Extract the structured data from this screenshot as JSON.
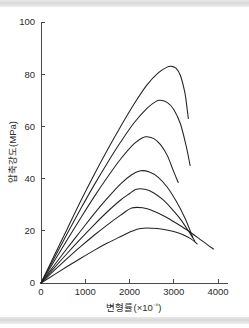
{
  "figure": {
    "background_color": "#ffffff",
    "band_color": "#dcdcdc",
    "curve_color": "#222222",
    "axis_color": "#4a4a4a"
  },
  "chart_data": {
    "type": "line",
    "title": "",
    "xlabel": "변형률(×10⁻⁶)",
    "ylabel": "압축강도(MPa)",
    "xlim": [
      0,
      4300
    ],
    "ylim": [
      0,
      100
    ],
    "xticks": [
      0,
      1000,
      2000,
      3000,
      4000
    ],
    "xtick_labels": [
      "0",
      "1000",
      "2000",
      "3000",
      "4000"
    ],
    "yticks": [
      0,
      20,
      40,
      60,
      80,
      100
    ],
    "ytick_labels": [
      "0",
      "20",
      "40",
      "60",
      "80",
      "100"
    ],
    "grid": false,
    "legend": "none",
    "series": [
      {
        "name": "curve-1",
        "peak_strain": 2950,
        "peak_stress": 83,
        "end_strain": 3330,
        "end_stress": 63,
        "x": [
          0,
          300,
          600,
          900,
          1200,
          1500,
          1800,
          2100,
          2400,
          2650,
          2850,
          2950,
          3050,
          3150,
          3250,
          3300,
          3330
        ],
        "y": [
          0,
          10.5,
          21.0,
          31.5,
          41.5,
          51.0,
          60.0,
          68.5,
          76.0,
          80.5,
          82.7,
          83.0,
          82.3,
          79.5,
          73.0,
          67.0,
          63.0
        ]
      },
      {
        "name": "curve-2",
        "peak_strain": 2700,
        "peak_stress": 70,
        "end_strain": 3370,
        "end_stress": 45,
        "x": [
          0,
          300,
          600,
          900,
          1200,
          1500,
          1800,
          2100,
          2400,
          2600,
          2700,
          2850,
          3000,
          3150,
          3280,
          3370
        ],
        "y": [
          0,
          9.6,
          19.2,
          28.5,
          37.5,
          46.0,
          54.0,
          61.3,
          67.0,
          69.6,
          70.0,
          69.2,
          66.5,
          61.0,
          52.5,
          45.0
        ]
      },
      {
        "name": "curve-3",
        "peak_strain": 2400,
        "peak_stress": 56,
        "end_strain": 3100,
        "end_stress": 38.5,
        "x": [
          0,
          300,
          600,
          900,
          1200,
          1500,
          1800,
          2100,
          2300,
          2400,
          2550,
          2700,
          2850,
          2980,
          3100
        ],
        "y": [
          0,
          8.4,
          16.8,
          25.0,
          33.0,
          40.5,
          47.5,
          53.3,
          55.7,
          56.0,
          55.3,
          53.0,
          49.0,
          43.5,
          38.5
        ]
      },
      {
        "name": "curve-4",
        "peak_strain": 2250,
        "peak_stress": 43,
        "end_strain": 3430,
        "end_stress": 17.5,
        "x": [
          0,
          300,
          600,
          900,
          1200,
          1500,
          1800,
          2050,
          2250,
          2450,
          2650,
          2850,
          3050,
          3250,
          3430
        ],
        "y": [
          0,
          6.8,
          13.5,
          20.0,
          26.5,
          32.5,
          38.0,
          41.5,
          43.0,
          42.5,
          40.5,
          36.8,
          31.5,
          25.0,
          17.5
        ]
      },
      {
        "name": "curve-5",
        "peak_strain": 2150,
        "peak_stress": 36,
        "end_strain": 3480,
        "end_stress": 16,
        "x": [
          0,
          300,
          600,
          900,
          1200,
          1500,
          1800,
          2000,
          2150,
          2350,
          2550,
          2750,
          2950,
          3150,
          3350,
          3480
        ],
        "y": [
          0,
          5.8,
          11.5,
          17.0,
          22.3,
          27.3,
          31.8,
          34.2,
          35.9,
          35.9,
          34.5,
          32.0,
          28.5,
          24.5,
          19.5,
          16.0
        ]
      },
      {
        "name": "curve-6",
        "peak_strain": 2050,
        "peak_stress": 29,
        "end_strain": 3900,
        "end_stress": 13,
        "x": [
          0,
          300,
          600,
          900,
          1200,
          1500,
          1800,
          2050,
          2300,
          2550,
          2800,
          3050,
          3300,
          3550,
          3750,
          3900
        ],
        "y": [
          0,
          4.8,
          9.5,
          14.0,
          18.3,
          22.3,
          26.0,
          28.7,
          28.8,
          27.5,
          25.5,
          23.0,
          20.3,
          17.3,
          14.8,
          13.0
        ]
      },
      {
        "name": "curve-7",
        "peak_strain": 2250,
        "peak_stress": 21,
        "end_strain": 3530,
        "end_stress": 15,
        "x": [
          0,
          300,
          600,
          900,
          1200,
          1500,
          1800,
          2050,
          2250,
          2500,
          2750,
          3000,
          3200,
          3380,
          3530
        ],
        "y": [
          0,
          3.2,
          6.4,
          9.5,
          12.5,
          15.3,
          17.8,
          19.8,
          20.9,
          21.0,
          20.6,
          19.7,
          18.6,
          17.0,
          15.0
        ]
      }
    ]
  }
}
